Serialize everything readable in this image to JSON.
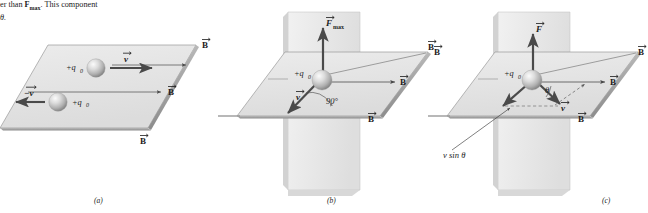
{
  "figure": {
    "caption_line1_pre": "er than ",
    "caption_line1_bold": "F",
    "caption_line1_sub": "max",
    "caption_line1_post": ". This component",
    "caption_line2": "θ.",
    "panels": [
      {
        "id": "a",
        "label": "(a)",
        "charge_labels": [
          "+q",
          "+q"
        ],
        "charge_sub": "0",
        "velocity_labels": [
          "v",
          "−v"
        ],
        "field_labels": [
          "B",
          "B",
          "B"
        ]
      },
      {
        "id": "b",
        "label": "(b)",
        "charge_label": "+q",
        "charge_sub": "0",
        "force_label": "F",
        "force_sub": "max",
        "velocity_label": "v",
        "angle_label": "90°",
        "field_labels": [
          "B",
          "B",
          "B"
        ]
      },
      {
        "id": "c",
        "label": "(c)",
        "charge_label": "+q",
        "charge_sub": "0",
        "force_label": "F",
        "velocity_label": "v",
        "angle_label": "θ",
        "component_label": "v sin θ",
        "field_labels": [
          "B",
          "B",
          "B",
          "B"
        ]
      }
    ],
    "colors": {
      "plane_fill": "#e6e6e6",
      "plane_fill_vertical": "#ededed",
      "plane_edge": "#8f8f8f",
      "arrow": "#4a4a4a",
      "sphere_light": "#f2f2f2",
      "sphere_mid": "#c9c9c9",
      "sphere_dark": "#8a8a8a",
      "text": "#1b1b1b",
      "background": "#ffffff"
    }
  }
}
